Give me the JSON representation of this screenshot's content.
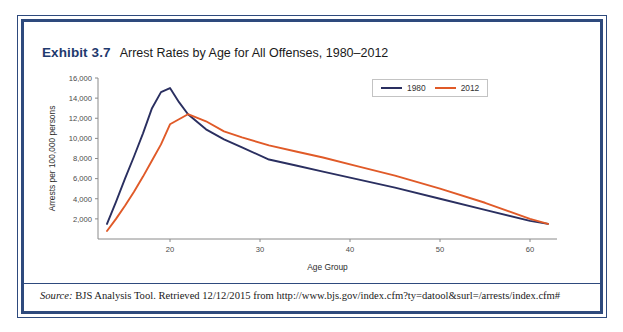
{
  "figure": {
    "exhibit_tag": "Exhibit 3.7",
    "title": "Arrest Rates by Age for All Offenses, 1980–2012",
    "border_color": "#2e4a7d"
  },
  "source": {
    "label": "Source:",
    "text": " BJS Analysis Tool. Retrieved 12/12/2015 from http://www.bjs.gov/index.cfm?ty=datool&surl=/arrests/index.cfm#"
  },
  "legend": {
    "position": "top-right",
    "entries": [
      {
        "label": "1980",
        "color": "#2a2f60"
      },
      {
        "label": "2012",
        "color": "#e05a28"
      }
    ]
  },
  "chart_data": {
    "type": "line",
    "title": "Arrest Rates by Age for All Offenses, 1980–2012",
    "xlabel": "Age Group",
    "ylabel": "Arrests per 100,000 persons",
    "xlim": [
      12,
      63
    ],
    "ylim": [
      0,
      16000
    ],
    "xticks": [
      20,
      30,
      40,
      50,
      60
    ],
    "yticks": [
      2000,
      4000,
      6000,
      8000,
      10000,
      12000,
      14000,
      16000
    ],
    "ytick_labels": [
      "2,000",
      "4,000",
      "6,000",
      "8,000",
      "10,000",
      "12,000",
      "14,000",
      "16,000"
    ],
    "xtick_labels": [
      "20",
      "30",
      "40",
      "50",
      "60"
    ],
    "grid": false,
    "x": [
      13,
      14,
      15,
      16,
      17,
      18,
      19,
      20,
      21,
      22,
      24,
      26,
      28,
      31,
      34,
      37,
      41,
      45,
      50,
      55,
      60,
      62
    ],
    "series": [
      {
        "name": "1980",
        "color": "#2a2f60",
        "values": [
          1500,
          3700,
          6000,
          8200,
          10500,
          13000,
          14600,
          15000,
          13600,
          12400,
          10900,
          9900,
          9100,
          7900,
          7300,
          6700,
          5900,
          5100,
          4000,
          2900,
          1800,
          1500
        ]
      },
      {
        "name": "2012",
        "color": "#e05a28",
        "values": [
          800,
          2000,
          3300,
          4700,
          6200,
          7800,
          9400,
          11400,
          11900,
          12400,
          11700,
          10700,
          10100,
          9300,
          8700,
          8100,
          7200,
          6300,
          5000,
          3600,
          2000,
          1500
        ]
      }
    ]
  }
}
